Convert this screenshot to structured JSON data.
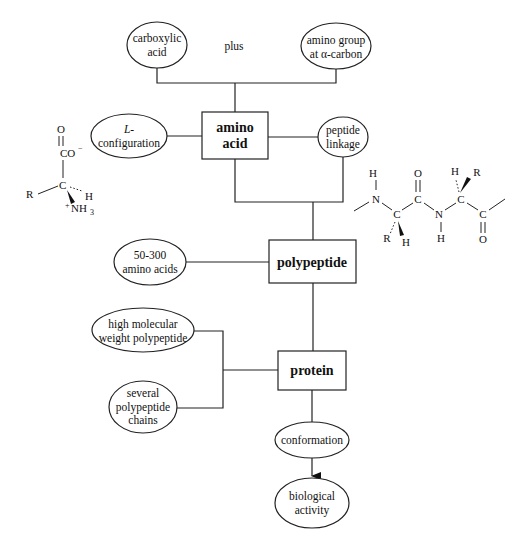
{
  "diagram": {
    "title": "",
    "nodes": {
      "carboxylic_acid": {
        "line1": "carboxylic",
        "line2": "acid"
      },
      "plus": {
        "label": "plus"
      },
      "amino_group": {
        "line1": "amino group",
        "line2": "at α-carbon"
      },
      "amino_acid": {
        "line1": "amino",
        "line2": "acid"
      },
      "l_configuration": {
        "line1": "L-",
        "line2": "configuration"
      },
      "peptide_linkage": {
        "line1": "peptide",
        "line2": "linkage"
      },
      "polypeptide": {
        "label": "polypeptide"
      },
      "range_amino_acids": {
        "line1": "50-300",
        "line2": "amino acids"
      },
      "protein": {
        "label": "protein"
      },
      "high_mw": {
        "line1": "high molecular",
        "line2": "weight polypeptide"
      },
      "several_chains": {
        "line1": "several",
        "line2": "polypeptide",
        "line3": "chains"
      },
      "conformation": {
        "label": "conformation"
      },
      "biological_activity": {
        "line1": "biological",
        "line2": "activity"
      }
    },
    "edges": [
      {
        "from": "carboxylic_acid",
        "to": "amino_acid"
      },
      {
        "from": "amino_group",
        "to": "amino_acid"
      },
      {
        "from": "l_configuration",
        "to": "amino_acid"
      },
      {
        "from": "amino_acid",
        "to": "peptide_linkage"
      },
      {
        "from": "amino_acid",
        "to": "polypeptide"
      },
      {
        "from": "peptide_linkage",
        "to": "polypeptide"
      },
      {
        "from": "range_amino_acids",
        "to": "polypeptide"
      },
      {
        "from": "polypeptide",
        "to": "protein"
      },
      {
        "from": "high_mw",
        "to": "protein"
      },
      {
        "from": "several_chains",
        "to": "protein"
      },
      {
        "from": "protein",
        "to": "conformation"
      },
      {
        "from": "conformation",
        "to": "biological_activity",
        "arrow": true
      }
    ],
    "amino_acid_structure": {
      "o": "O",
      "co": "CO",
      "co_charge": "−",
      "c": "C",
      "r": "R",
      "h": "H",
      "plus": "+",
      "nh": "NH",
      "nh_sub": "3"
    },
    "peptide_structure": {
      "h": "H",
      "n": "N",
      "c": "C",
      "o": "O",
      "r": "R"
    }
  }
}
